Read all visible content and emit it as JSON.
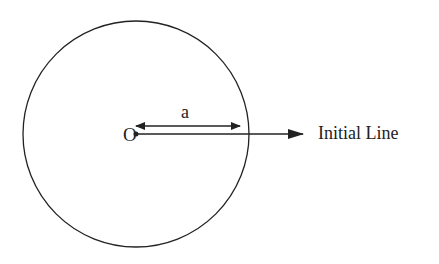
{
  "diagram": {
    "type": "polar-circle",
    "labels": {
      "origin": "O",
      "radius": "a",
      "initial_line": "Initial Line"
    },
    "circle": {
      "cx": 136,
      "cy": 134,
      "r": 113
    },
    "colors": {
      "stroke": "#222222",
      "background": "#ffffff"
    }
  }
}
